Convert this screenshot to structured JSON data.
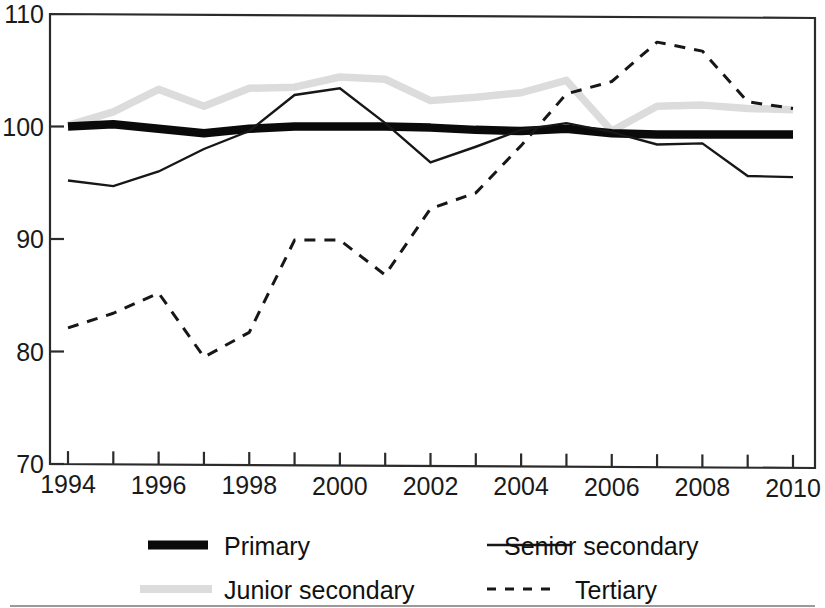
{
  "chart_data": {
    "type": "line",
    "title": "",
    "subtitle": "",
    "xlabel": "",
    "ylabel": "",
    "xlim": [
      1994,
      2010
    ],
    "ylim": [
      70,
      110
    ],
    "grid": false,
    "legend_position": "bottom",
    "x": [
      1994,
      1995,
      1996,
      1997,
      1998,
      1999,
      2000,
      2001,
      2002,
      2003,
      2004,
      2005,
      2006,
      2007,
      2008,
      2009,
      2010
    ],
    "x_tick_labels": [
      "1994",
      "1995",
      "1996",
      "1997",
      "1998",
      "1999",
      "2000",
      "2001",
      "2002",
      "2003",
      "2004",
      "2005",
      "2006",
      "2007",
      "2008",
      "2009",
      "2010"
    ],
    "x_tick_labels_shown": [
      "1994",
      "1996",
      "1998",
      "2000",
      "2002",
      "2004",
      "2006",
      "2008",
      "2010"
    ],
    "y_tick_labels": [
      "70",
      "80",
      "90",
      "100",
      "110"
    ],
    "y_ticks": [
      70,
      80,
      90,
      100,
      110
    ],
    "series": [
      {
        "name": "Primary",
        "style": "thick-solid-black",
        "color": "#0a0a0a",
        "values": [
          100.0,
          100.2,
          99.8,
          99.4,
          99.8,
          100.0,
          100.0,
          100.0,
          99.9,
          99.7,
          99.6,
          99.8,
          99.4,
          99.3,
          99.3,
          99.3,
          99.3
        ]
      },
      {
        "name": "Junior secondary",
        "style": "thick-solid-gray",
        "color": "#dcdcdc",
        "values": [
          100.1,
          101.3,
          103.3,
          101.8,
          103.4,
          103.5,
          104.4,
          104.2,
          102.3,
          102.6,
          103.0,
          104.1,
          99.6,
          101.8,
          101.9,
          101.6,
          101.5
        ]
      },
      {
        "name": "Senior secondary",
        "style": "thin-solid-black",
        "color": "#171717",
        "values": [
          95.2,
          94.7,
          96.0,
          98.0,
          99.6,
          102.8,
          103.4,
          100.3,
          96.8,
          98.2,
          99.7,
          100.3,
          99.5,
          98.4,
          98.5,
          95.6,
          95.5
        ]
      },
      {
        "name": "Tertiary",
        "style": "dashed-black",
        "color": "#171717",
        "values": [
          82.1,
          83.4,
          85.2,
          79.5,
          81.7,
          89.9,
          89.9,
          86.8,
          92.7,
          94.1,
          98.3,
          102.9,
          104.0,
          107.5,
          106.7,
          102.2,
          101.6
        ]
      }
    ],
    "legend": [
      {
        "label": "Primary",
        "style": "thick-solid-black"
      },
      {
        "label": "Senior secondary",
        "style": "thin-solid-black"
      },
      {
        "label": "Junior secondary",
        "style": "thick-solid-gray"
      },
      {
        "label": "Tertiary",
        "style": "dashed-black"
      }
    ]
  }
}
